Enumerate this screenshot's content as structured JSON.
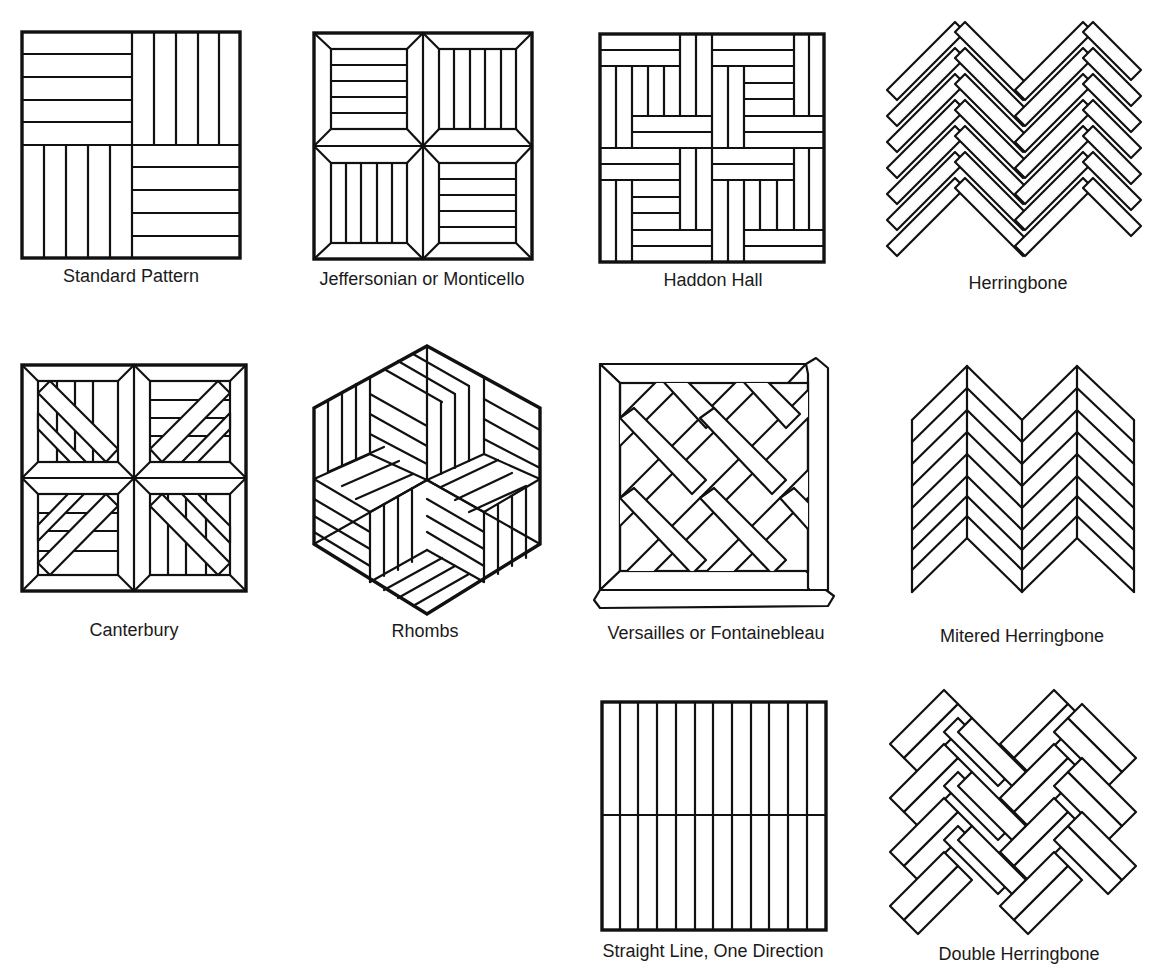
{
  "figure": {
    "patterns": [
      {
        "id": "standard",
        "label": "Standard Pattern"
      },
      {
        "id": "jeffersonian",
        "label": "Jeffersonian or Monticello"
      },
      {
        "id": "haddon-hall",
        "label": "Haddon Hall"
      },
      {
        "id": "herringbone",
        "label": "Herringbone"
      },
      {
        "id": "canterbury",
        "label": "Canterbury"
      },
      {
        "id": "rhombs",
        "label": "Rhombs"
      },
      {
        "id": "versailles",
        "label": "Versailles or Fontainebleau"
      },
      {
        "id": "mitered-herringbone",
        "label": "Mitered Herringbone"
      },
      {
        "id": "straight-line",
        "label": "Straight Line, One Direction"
      },
      {
        "id": "double-herringbone",
        "label": "Double Herringbone"
      }
    ]
  }
}
